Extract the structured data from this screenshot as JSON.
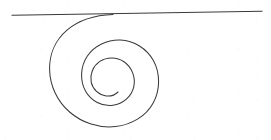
{
  "figure": {
    "background_color": "#ffffff",
    "ink_color": "#3a3a3c",
    "width": 271,
    "height": 140,
    "caption": "",
    "elements": [
      {
        "name": "tangent-line",
        "type": "line",
        "x1": 12,
        "y1": 15.2,
        "x2": 262,
        "y2": 11.2,
        "stroke_width": 1.15
      },
      {
        "name": "spiral-curve",
        "type": "logarithmic-spiral",
        "turns": 1.75,
        "center_x": 110,
        "center_y": 84,
        "start_x": 113,
        "start_y": 14.5,
        "end_x": 108,
        "end_y": 88,
        "stroke_width": 1.05,
        "path": "M 113.0 14.6 C 95.0 15.2 78.5 20.4 67.0 30.2 C 55.4 40.1 49.2 54.6 49.6 69.7 C 50.0 85.9 57.4 101.4 69.6 112.0 C 82.1 122.9 99.0 128.4 115.5 126.6 C 131.3 124.9 145.8 116.4 153.2 102.9 C 160.3 89.9 160.4 73.4 153.4 60.6 C 146.8 48.5 134.0 40.5 120.3 40.0 C 107.3 39.6 94.3 45.6 87.2 56.3 C 80.4 66.6 79.6 80.6 85.6 91.2 C 91.1 100.9 102.0 106.7 112.9 105.3 C 123.0 104.0 131.7 96.5 133.8 86.6 C 135.8 77.3 131.8 67.0 124.0 61.7 C 116.8 56.8 106.9 56.6 99.8 61.4 C 93.1 65.9 89.6 74.4 91.2 82.2 C 92.7 89.4 98.9 95.1 106.1 95.9 C 110.4 96.4 114.9 95.0 118.0 92.0"
      }
    ]
  }
}
